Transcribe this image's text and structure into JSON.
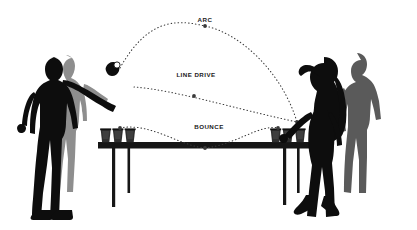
{
  "diagram": {
    "background_color": "#ffffff",
    "width": 417,
    "height": 230
  },
  "palette": {
    "silhouette_black": "#0d0d0d",
    "silhouette_gray_dark": "#5a5a5a",
    "silhouette_gray_light": "#8e8e8e",
    "table_color": "#161616",
    "cup_color": "#2b2b2b",
    "cup_rim_color": "#111111",
    "trajectory_color": "#3a3a3a",
    "label_color": "#1a1a1a",
    "marker_color": "#3a3a3a"
  },
  "labels": [
    {
      "id": "arc",
      "text": "ARC",
      "x": 205,
      "y": 17
    },
    {
      "id": "line_drive",
      "text": "LINE DRIVE",
      "x": 196,
      "y": 72
    },
    {
      "id": "bounce",
      "text": "BOUNCE",
      "x": 209,
      "y": 124
    }
  ],
  "trajectories": [
    {
      "id": "arc",
      "name": "ARC",
      "style": "dotted",
      "start": {
        "x": 120,
        "y": 68
      },
      "apex": {
        "x": 205,
        "y": 25
      },
      "end": {
        "x": 297,
        "y": 122
      },
      "control_1": {
        "x": 150,
        "y": 14
      },
      "control_2": {
        "x": 268,
        "y": 30
      },
      "marker": {
        "x": 205,
        "y": 26
      }
    },
    {
      "id": "line_drive",
      "name": "LINE DRIVE",
      "style": "dotted",
      "start": {
        "x": 134,
        "y": 87
      },
      "end": {
        "x": 297,
        "y": 122
      },
      "control_1": {
        "x": 190,
        "y": 90
      },
      "control_2": {
        "x": 250,
        "y": 105
      },
      "marker": {
        "x": 194,
        "y": 96
      }
    },
    {
      "id": "bounce",
      "name": "BOUNCE",
      "style": "dotted",
      "start": {
        "x": 120,
        "y": 128
      },
      "bounce_point": {
        "x": 205,
        "y": 148
      },
      "end": {
        "x": 278,
        "y": 128
      },
      "control_1": {
        "x": 150,
        "y": 124
      },
      "control_2": {
        "x": 180,
        "y": 146
      },
      "control_3": {
        "x": 235,
        "y": 144
      },
      "control_4": {
        "x": 258,
        "y": 124
      },
      "markers": [
        {
          "x": 120,
          "y": 128
        },
        {
          "x": 205,
          "y": 148
        },
        {
          "x": 278,
          "y": 128
        }
      ]
    }
  ],
  "table": {
    "id": "beer-pong-table",
    "surface": {
      "x": 98,
      "y": 142,
      "width": 215,
      "height": 7
    },
    "legs": [
      {
        "x": 112,
        "y": 149,
        "width": 3,
        "height": 58
      },
      {
        "x": 127,
        "y": 149,
        "width": 3,
        "height": 44
      },
      {
        "x": 283,
        "y": 149,
        "width": 3,
        "height": 56
      },
      {
        "x": 297,
        "y": 149,
        "width": 3,
        "height": 44
      }
    ]
  },
  "cups": {
    "left_group": {
      "count": 3,
      "positions": [
        {
          "x": 101,
          "y": 129
        },
        {
          "x": 113,
          "y": 129
        },
        {
          "x": 125,
          "y": 129
        }
      ],
      "width": 10,
      "height": 14
    },
    "right_group": {
      "count": 3,
      "positions": [
        {
          "x": 271,
          "y": 129
        },
        {
          "x": 283,
          "y": 129
        },
        {
          "x": 295,
          "y": 129
        }
      ],
      "width": 10,
      "height": 14
    }
  },
  "figures": [
    {
      "id": "left-male-thrower",
      "role": "thrower",
      "tone": "black",
      "side": "left",
      "description": "male silhouette throwing ball, arm extended"
    },
    {
      "id": "left-female-background",
      "role": "teammate",
      "tone": "gray-light",
      "side": "left",
      "description": "female silhouette standing behind"
    },
    {
      "id": "right-female-defender",
      "role": "defender",
      "tone": "black",
      "side": "right",
      "description": "female silhouette with arm raised to head"
    },
    {
      "id": "right-male-background",
      "role": "teammate",
      "tone": "gray-dark",
      "side": "right",
      "description": "male silhouette standing behind"
    }
  ],
  "ball": {
    "id": "thrown-ball",
    "x": 120,
    "y": 67,
    "radius": 3.2
  }
}
